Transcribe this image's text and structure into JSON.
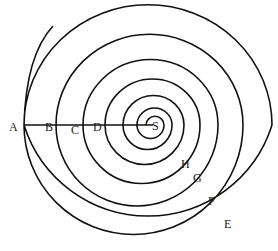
{
  "diagram": {
    "type": "spiral",
    "line_color": "#111111",
    "background": "#ffffff",
    "center": {
      "label": "S",
      "x": 155,
      "y": 125
    },
    "radial_line": {
      "from": "A",
      "to": "S"
    },
    "left_points": [
      {
        "label": "A",
        "x": 9,
        "y": 131
      },
      {
        "label": "B",
        "x": 45,
        "y": 131
      },
      {
        "label": "C",
        "x": 71,
        "y": 134
      },
      {
        "label": "D",
        "x": 93,
        "y": 131
      }
    ],
    "right_points": [
      {
        "label": "H",
        "x": 181,
        "y": 168
      },
      {
        "label": "G",
        "x": 193,
        "y": 182
      },
      {
        "label": "F",
        "x": 208,
        "y": 205
      },
      {
        "label": "E",
        "x": 224,
        "y": 228
      }
    ],
    "spiral_crossings_left_x": [
      146,
      137,
      123,
      105,
      83,
      56,
      24
    ],
    "spiral_crossings_right_x": [
      164,
      172,
      184,
      200,
      218,
      243,
      272
    ],
    "outer_tip": {
      "x": 53,
      "y": 26
    }
  }
}
